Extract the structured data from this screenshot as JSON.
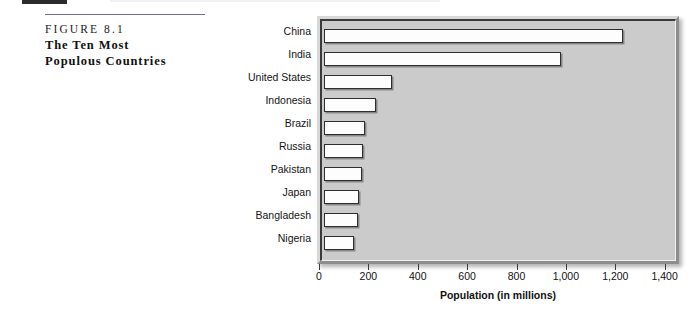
{
  "caption": {
    "figure_number": "FIGURE 8.1",
    "title_line_1": "The Ten Most",
    "title_line_2": "Populous Countries"
  },
  "colors": {
    "bar_fill": "#fdfdfd",
    "bar_outline": "#2e2e2e",
    "plot_background": "#cbcbcb",
    "crowd_silhouette": "#8e8e8e",
    "text": "#111111"
  },
  "chart_data": {
    "type": "bar",
    "orientation": "horizontal",
    "title": "",
    "xlabel": "Population (in millions)",
    "ylabel": "",
    "xlim": [
      0,
      1400
    ],
    "xticks": [
      0,
      200,
      400,
      600,
      800,
      1000,
      1200,
      1400
    ],
    "xtick_labels": [
      "0",
      "200",
      "400",
      "600",
      "800",
      "1,000",
      "1,200",
      "1,400"
    ],
    "grid": false,
    "legend": null,
    "categories": [
      "China",
      "India",
      "United States",
      "Indonesia",
      "Brazil",
      "Russia",
      "Pakistan",
      "Japan",
      "Bangladesh",
      "Nigeria"
    ],
    "values": [
      1212,
      960,
      276,
      212,
      168,
      156,
      152,
      140,
      136,
      120
    ]
  },
  "illustration": {
    "name": "crowd-of-people-silhouette"
  }
}
